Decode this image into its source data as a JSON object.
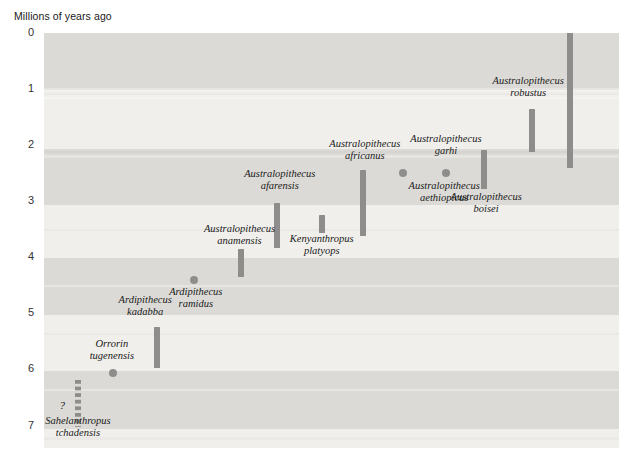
{
  "chart_data": {
    "type": "range-timeline",
    "title": "",
    "ylabel": "Millions of years ago",
    "xlabel": "",
    "ylim": [
      0,
      7.4
    ],
    "y_inverted": true,
    "yticks": [
      "0",
      "1",
      "2",
      "3",
      "4",
      "5",
      "6",
      "7"
    ],
    "grid": false,
    "legend": "none",
    "bar_color": "#8e8d8c",
    "band_colors": [
      "#dcdad6",
      "#f0efec"
    ],
    "taxa": [
      {
        "name": "Homo",
        "label_lines": [
          "Homo"
        ],
        "mark": "bar",
        "from_ma": 0.0,
        "to_ma": 2.4,
        "x_pct": 91.5,
        "label_x_pct": 91.5,
        "label_top_px": -22
      },
      {
        "name": "Australopithecus robustus",
        "label_lines": [
          "Australopithecus",
          "robustus"
        ],
        "mark": "bar",
        "from_ma": 1.35,
        "to_ma": 2.12,
        "x_pct": 84.9,
        "label_x_pct": 84.2,
        "label_top_px": 42
      },
      {
        "name": "Australopithecus boisei",
        "label_lines": [
          "Australopithecus",
          "boisei"
        ],
        "mark": "bar",
        "from_ma": 2.08,
        "to_ma": 2.78,
        "x_pct": 76.6,
        "label_x_pct": 76.9,
        "label_top_px": 158
      },
      {
        "name": "Australopithecus garhi",
        "label_lines": [
          "Australopithecus",
          "garhi"
        ],
        "mark": "dot",
        "at_ma": 2.49,
        "x_pct": 69.9,
        "label_x_pct": 69.9,
        "label_top_px": 100
      },
      {
        "name": "Australopithecus aethiopicus",
        "label_lines": [
          "Australopithecus",
          "aethiopicus"
        ],
        "mark": "dot",
        "at_ma": 2.49,
        "x_pct": 62.4,
        "label_x_pct": 69.6,
        "label_top_px": 147
      },
      {
        "name": "Australopithecus africanus",
        "label_lines": [
          "Australopithecus",
          "africanus"
        ],
        "mark": "bar",
        "from_ma": 2.45,
        "to_ma": 3.62,
        "x_pct": 55.5,
        "label_x_pct": 55.8,
        "label_top_px": 105
      },
      {
        "name": "Kenyanthropus platyops",
        "label_lines": [
          "Kenyanthropus",
          "platyops"
        ],
        "mark": "bar",
        "from_ma": 3.24,
        "to_ma": 3.57,
        "x_pct": 48.3,
        "label_x_pct": 48.3,
        "label_top_px": 200
      },
      {
        "name": "Australopithecus afarensis",
        "label_lines": [
          "Australopithecus",
          "afarensis"
        ],
        "mark": "bar",
        "from_ma": 3.04,
        "to_ma": 3.83,
        "x_pct": 40.6,
        "label_x_pct": 41.0,
        "label_top_px": 135
      },
      {
        "name": "Australopithecus anamensis",
        "label_lines": [
          "Australopithecus",
          "anamensis"
        ],
        "mark": "bar",
        "from_ma": 3.85,
        "to_ma": 4.35,
        "x_pct": 34.3,
        "label_x_pct": 34.0,
        "label_top_px": 190
      },
      {
        "name": "Ardipithecus ramidus",
        "label_lines": [
          "Ardipithecus",
          "ramidus"
        ],
        "mark": "dot",
        "at_ma": 4.4,
        "x_pct": 26.1,
        "label_x_pct": 26.4,
        "label_top_px": 253
      },
      {
        "name": "Ardipithecus kadabba",
        "label_lines": [
          "Ardipithecus",
          "kadabba"
        ],
        "mark": "bar",
        "from_ma": 5.25,
        "to_ma": 5.97,
        "x_pct": 19.6,
        "label_x_pct": 17.6,
        "label_top_px": 261
      },
      {
        "name": "Orrorin tugenensis",
        "label_lines": [
          "Orrorin",
          "tugenensis"
        ],
        "mark": "dot",
        "at_ma": 6.07,
        "x_pct": 12.0,
        "label_x_pct": 11.8,
        "label_top_px": 305
      },
      {
        "name": "Sahelanthropus tchadensis",
        "label_lines": [
          "Sahelanthropus",
          "tchadensis"
        ],
        "mark": "dashed-bar",
        "from_ma": 6.18,
        "to_ma": 7.02,
        "x_pct": 5.9,
        "label_x_pct": 5.9,
        "label_top_px": 382
      }
    ],
    "annotations": [
      {
        "text": "?",
        "x_pct": 2.7,
        "y_ma": 6.65
      }
    ]
  }
}
